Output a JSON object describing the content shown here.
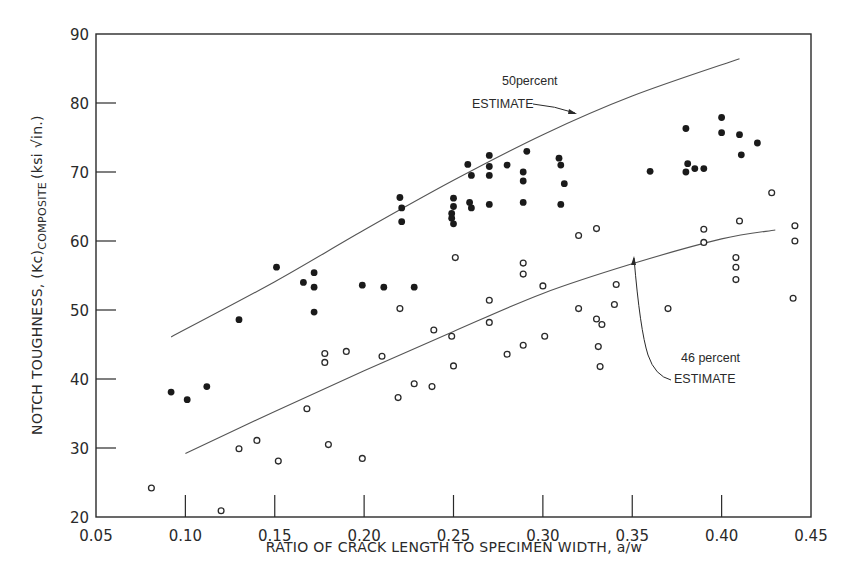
{
  "chart_data": {
    "type": "scatter",
    "title": "",
    "xlabel": "RATIO OF CRACK LENGTH TO SPECIMEN WIDTH, a/w",
    "ylabel": "NOTCH TOUGHNESS, (Kc)COMPOSITE (ksi √in.)",
    "ylabel_parts": {
      "main": "NOTCH TOUGHNESS, (Kc)",
      "subscript": "COMPOSITE",
      "units": "(ksi √in.)"
    },
    "xlim": [
      0.05,
      0.45
    ],
    "ylim": [
      20,
      90
    ],
    "x_ticks": [
      "0.05",
      "0.10",
      "0.15",
      "0.20",
      "0.25",
      "0.30",
      "0.35",
      "0.40",
      "0.45"
    ],
    "y_ticks": [
      "20",
      "30",
      "40",
      "50",
      "60",
      "70",
      "80",
      "90"
    ],
    "grid": false,
    "series": [
      {
        "name": "filled",
        "marker": "filled-circle",
        "points": [
          [
            0.092,
            38.1
          ],
          [
            0.101,
            37.0
          ],
          [
            0.112,
            38.9
          ],
          [
            0.13,
            48.6
          ],
          [
            0.151,
            56.2
          ],
          [
            0.166,
            54.0
          ],
          [
            0.172,
            55.4
          ],
          [
            0.172,
            53.3
          ],
          [
            0.172,
            49.7
          ],
          [
            0.199,
            53.6
          ],
          [
            0.211,
            53.3
          ],
          [
            0.228,
            53.3
          ],
          [
            0.22,
            66.3
          ],
          [
            0.221,
            64.8
          ],
          [
            0.221,
            62.8
          ],
          [
            0.25,
            66.2
          ],
          [
            0.25,
            65.0
          ],
          [
            0.249,
            64.0
          ],
          [
            0.249,
            63.3
          ],
          [
            0.25,
            62.5
          ],
          [
            0.258,
            71.1
          ],
          [
            0.259,
            65.6
          ],
          [
            0.26,
            64.8
          ],
          [
            0.26,
            69.5
          ],
          [
            0.27,
            72.4
          ],
          [
            0.27,
            70.8
          ],
          [
            0.27,
            69.5
          ],
          [
            0.27,
            65.3
          ],
          [
            0.28,
            71.0
          ],
          [
            0.289,
            70.0
          ],
          [
            0.289,
            68.7
          ],
          [
            0.289,
            65.6
          ],
          [
            0.291,
            73.0
          ],
          [
            0.309,
            72.0
          ],
          [
            0.31,
            71.0
          ],
          [
            0.312,
            68.3
          ],
          [
            0.31,
            65.3
          ],
          [
            0.36,
            70.1
          ],
          [
            0.38,
            76.3
          ],
          [
            0.381,
            71.2
          ],
          [
            0.38,
            70.0
          ],
          [
            0.385,
            70.5
          ],
          [
            0.39,
            70.5
          ],
          [
            0.4,
            77.9
          ],
          [
            0.4,
            75.7
          ],
          [
            0.41,
            75.4
          ],
          [
            0.411,
            72.5
          ],
          [
            0.42,
            74.2
          ]
        ]
      },
      {
        "name": "open",
        "marker": "open-circle",
        "points": [
          [
            0.081,
            24.2
          ],
          [
            0.12,
            20.9
          ],
          [
            0.13,
            29.9
          ],
          [
            0.14,
            31.1
          ],
          [
            0.152,
            28.1
          ],
          [
            0.168,
            35.7
          ],
          [
            0.178,
            43.7
          ],
          [
            0.178,
            42.4
          ],
          [
            0.18,
            30.5
          ],
          [
            0.19,
            44.0
          ],
          [
            0.199,
            28.5
          ],
          [
            0.219,
            37.3
          ],
          [
            0.21,
            43.3
          ],
          [
            0.22,
            50.2
          ],
          [
            0.228,
            39.3
          ],
          [
            0.238,
            38.9
          ],
          [
            0.239,
            47.1
          ],
          [
            0.249,
            46.2
          ],
          [
            0.25,
            41.9
          ],
          [
            0.251,
            57.6
          ],
          [
            0.27,
            51.4
          ],
          [
            0.27,
            48.2
          ],
          [
            0.28,
            43.6
          ],
          [
            0.289,
            56.8
          ],
          [
            0.289,
            55.2
          ],
          [
            0.289,
            44.9
          ],
          [
            0.3,
            53.5
          ],
          [
            0.301,
            46.2
          ],
          [
            0.32,
            60.8
          ],
          [
            0.32,
            50.2
          ],
          [
            0.33,
            61.8
          ],
          [
            0.33,
            48.7
          ],
          [
            0.331,
            44.7
          ],
          [
            0.332,
            41.8
          ],
          [
            0.333,
            47.9
          ],
          [
            0.34,
            50.8
          ],
          [
            0.341,
            53.7
          ],
          [
            0.37,
            50.2
          ],
          [
            0.39,
            61.7
          ],
          [
            0.39,
            59.8
          ],
          [
            0.41,
            62.9
          ],
          [
            0.408,
            57.6
          ],
          [
            0.408,
            56.2
          ],
          [
            0.408,
            54.4
          ],
          [
            0.428,
            67.0
          ],
          [
            0.441,
            62.2
          ],
          [
            0.441,
            60.0
          ],
          [
            0.44,
            51.7
          ]
        ]
      }
    ],
    "curves": [
      {
        "name": "50 percent estimate",
        "points": [
          [
            0.092,
            46.1
          ],
          [
            0.15,
            54.1
          ],
          [
            0.2,
            61.6
          ],
          [
            0.25,
            68.8
          ],
          [
            0.3,
            75.4
          ],
          [
            0.35,
            81.0
          ],
          [
            0.41,
            86.4
          ]
        ]
      },
      {
        "name": "46 percent estimate",
        "points": [
          [
            0.1,
            29.2
          ],
          [
            0.15,
            35.3
          ],
          [
            0.2,
            41.2
          ],
          [
            0.25,
            46.9
          ],
          [
            0.3,
            52.4
          ],
          [
            0.35,
            56.7
          ],
          [
            0.4,
            60.3
          ],
          [
            0.43,
            61.6
          ]
        ]
      }
    ],
    "annotations": [
      {
        "line1": "50percent",
        "line2": "ESTIMATE"
      },
      {
        "line1": "46 percent",
        "line2": "ESTIMATE"
      }
    ]
  }
}
